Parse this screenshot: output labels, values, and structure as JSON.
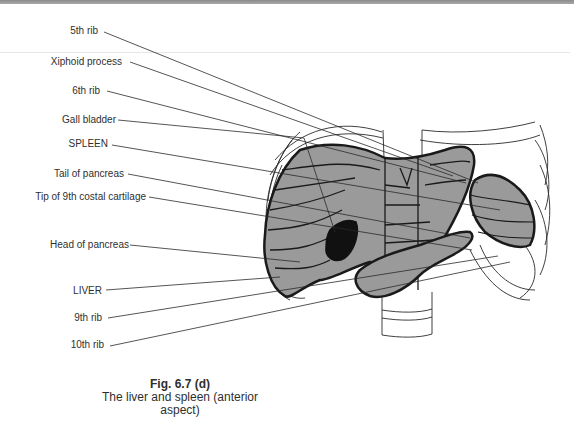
{
  "figure": {
    "number": "Fig. 6.7 (d)",
    "caption_line1": "The liver and spleen (anterior",
    "caption_line2": "aspect)"
  },
  "labels": [
    {
      "id": "5th-rib",
      "text": "5th rib"
    },
    {
      "id": "xiphoid-process",
      "text": "Xiphoid process"
    },
    {
      "id": "6th-rib",
      "text": "6th rib"
    },
    {
      "id": "gall-bladder",
      "text": "Gall bladder"
    },
    {
      "id": "spleen",
      "text": "SPLEEN"
    },
    {
      "id": "tail-of-pancreas",
      "text": "Tail of pancreas"
    },
    {
      "id": "tip-9th-costal-cartilage",
      "text": "Tip of 9th costal cartilage"
    },
    {
      "id": "head-of-pancreas",
      "text": "Head of pancreas"
    },
    {
      "id": "liver",
      "text": "LIVER"
    },
    {
      "id": "9th-rib",
      "text": "9th rib"
    },
    {
      "id": "10th-rib",
      "text": "10th rib"
    }
  ],
  "colors": {
    "organ_fill": "#9a9a9a",
    "gall_bladder_fill": "#111111",
    "outline": "#1a1a1a",
    "band": "#999999"
  }
}
